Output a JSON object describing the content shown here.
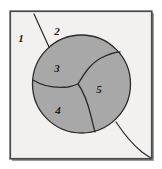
{
  "figure": {
    "canvas": {
      "width": 162,
      "height": 169
    },
    "colors": {
      "page_background": "#ffffff",
      "panel_background": "#f2f1ef",
      "disk_fill": "#a8a8a8",
      "stroke": "#2b2b2b",
      "frame_outer": "#8c8c8c",
      "frame_inner": "#4a4a4a",
      "label_color": "#1a1a1a"
    },
    "frame": {
      "x": 10,
      "y": 11,
      "width": 142,
      "height": 148
    },
    "disk": {
      "center_x": 81.5,
      "center_y": 84,
      "radius": 49
    },
    "labels": [
      {
        "id": "label-1",
        "text": "1",
        "x": 21,
        "y": 39,
        "location": "exterior-left"
      },
      {
        "id": "label-2",
        "text": "2",
        "x": 57,
        "y": 32,
        "location": "exterior-top"
      },
      {
        "id": "label-3",
        "text": "3",
        "x": 57,
        "y": 69,
        "location": "disk-upper-left"
      },
      {
        "id": "label-4",
        "text": "4",
        "x": 58,
        "y": 111,
        "location": "disk-lower-left"
      },
      {
        "id": "label-5",
        "text": "5",
        "x": 99,
        "y": 90,
        "location": "disk-right"
      }
    ],
    "curves": [
      {
        "id": "exterior-curve-top-left",
        "description": "line from top frame edge down to disk boundary, separating region 1 from region 2",
        "path": "M 34 14 L 49 47"
      },
      {
        "id": "divider-3-5",
        "description": "boundary between region 3 and region 5, from triple junction to upper-right disk edge",
        "path": "M 78 84 C 84 74 90 64 101 58 C 109 54 114 52 120 52"
      },
      {
        "id": "divider-3-4",
        "description": "boundary between region 3 and region 4, from left disk edge to triple junction",
        "path": "M 33 80 C 44 87 58 88 68 87 C 73 86 76 85 78 84"
      },
      {
        "id": "divider-4-5",
        "description": "boundary between region 4 and region 5, from triple junction down to bottom disk edge",
        "path": "M 78 84 C 84 92 88 104 91 116 C 93 124 94 129 95 132"
      },
      {
        "id": "exterior-curve-bottom-right",
        "description": "curve leaving disk at lower right and sweeping to the bottom-right frame edge",
        "path": "M 116 122 C 124 134 132 144 142 152 C 146 155 149 157 152 158"
      }
    ]
  }
}
